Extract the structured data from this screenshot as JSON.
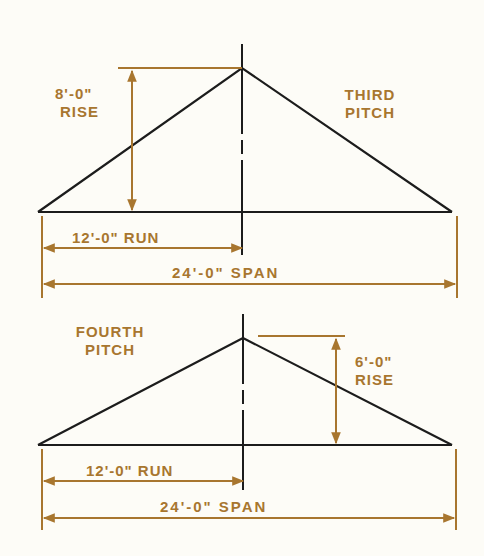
{
  "colors": {
    "dimension": "#a8762f",
    "outline": "#1c1c1c",
    "background": "#fdfcf7"
  },
  "third_pitch": {
    "title_line1": "THIRD",
    "title_line2": "PITCH",
    "rise_value": "8'-0\"",
    "rise_label": "RISE",
    "run_label": "12'-0\" RUN",
    "span_label": "24'-0\"  SPAN"
  },
  "fourth_pitch": {
    "title_line1": "FOURTH",
    "title_line2": "PITCH",
    "rise_value": "6'-0\"",
    "rise_label": "RISE",
    "run_label": "12'-0\" RUN",
    "span_label": "24'-0\" SPAN"
  }
}
